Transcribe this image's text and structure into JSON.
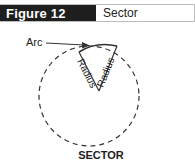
{
  "header": {
    "figure_label": "Figure 12",
    "title": "Sector"
  },
  "diagram": {
    "arc_label": "Arc",
    "radius_label_left": "Radius",
    "radius_label_right": "Radius",
    "caption": "SECTOR"
  }
}
